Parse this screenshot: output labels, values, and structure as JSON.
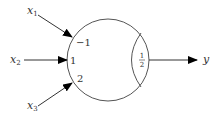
{
  "diagram": {
    "type": "threshold-neuron",
    "inputs": [
      {
        "name": "x",
        "subscript": "1",
        "weight": "−1"
      },
      {
        "name": "x",
        "subscript": "2",
        "weight": "1"
      },
      {
        "name": "x",
        "subscript": "3",
        "weight": "2"
      }
    ],
    "threshold": {
      "numerator": "1",
      "denominator": "2"
    },
    "output": {
      "name": "y"
    },
    "colors": {
      "stroke": "#555555",
      "arrow": "#000000",
      "text": "#333333"
    }
  }
}
